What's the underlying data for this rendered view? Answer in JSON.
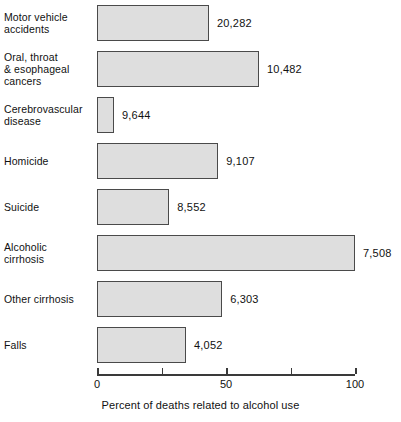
{
  "chart_data": {
    "type": "bar",
    "orientation": "horizontal",
    "title": "",
    "xlabel": "Percent of deaths related to alcohol use",
    "ylabel": "",
    "xlim": [
      0,
      100
    ],
    "xticks": [
      0,
      25,
      50,
      75,
      100
    ],
    "xtick_labels": [
      "0",
      "",
      "50",
      "",
      "100"
    ],
    "grid": false,
    "legend": null,
    "bar_fill_color": "#dedede",
    "bar_border_color": "#4a4a4a",
    "categories": [
      "Motor vehicle accidents",
      "Oral, throat & esophageal cancers",
      "Cerebrovascular disease",
      "Homicide",
      "Suicide",
      "Alcoholic cirrhosis",
      "Other cirrhosis",
      "Falls"
    ],
    "values": [
      43.4,
      62.8,
      6.6,
      47.0,
      28.0,
      100.0,
      48.5,
      34.5
    ],
    "data_labels": [
      "20,282",
      "10,482",
      "9,644",
      "9,107",
      "8,552",
      "7,508",
      "6,303",
      "4,052"
    ],
    "bars": [
      {
        "category_lines": [
          "Motor vehicle",
          "accidents"
        ],
        "percent": 43.4,
        "label": "20,282"
      },
      {
        "category_lines": [
          "Oral, throat",
          "& esophageal",
          "cancers"
        ],
        "percent": 62.8,
        "label": "10,482"
      },
      {
        "category_lines": [
          "Cerebrovascular",
          "disease"
        ],
        "percent": 6.6,
        "label": "9,644"
      },
      {
        "category_lines": [
          "Homicide"
        ],
        "percent": 47.0,
        "label": "9,107"
      },
      {
        "category_lines": [
          "Suicide"
        ],
        "percent": 28.0,
        "label": "8,552"
      },
      {
        "category_lines": [
          "Alcoholic",
          "cirrhosis"
        ],
        "percent": 100.0,
        "label": "7,508"
      },
      {
        "category_lines": [
          "Other cirrhosis"
        ],
        "percent": 48.5,
        "label": "6,303"
      },
      {
        "category_lines": [
          "Falls"
        ],
        "percent": 34.5,
        "label": "4,052"
      }
    ]
  },
  "axis": {
    "title": "Percent of deaths related to alcohol use",
    "ticks": [
      {
        "value": 0,
        "label": "0"
      },
      {
        "value": 25,
        "label": ""
      },
      {
        "value": 50,
        "label": "50"
      },
      {
        "value": 75,
        "label": ""
      },
      {
        "value": 100,
        "label": "100"
      }
    ]
  }
}
